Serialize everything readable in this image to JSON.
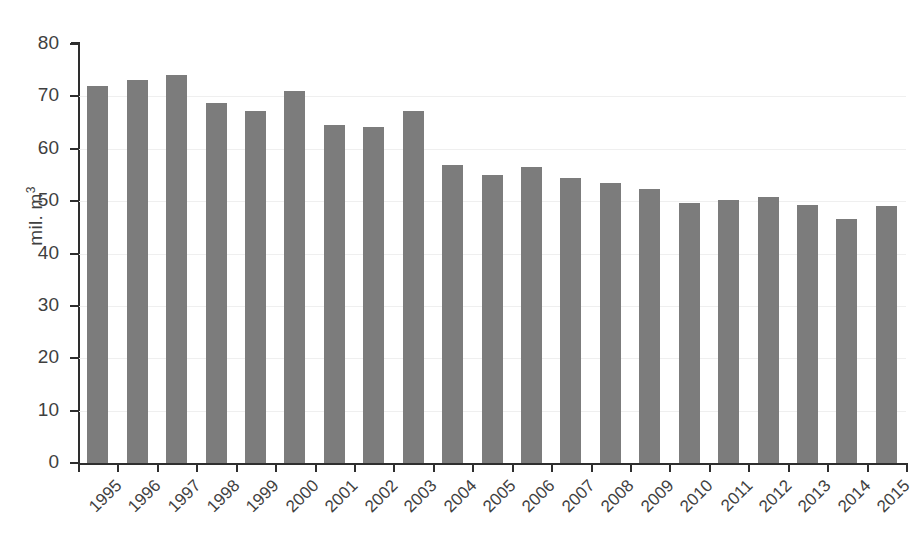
{
  "chart_data": {
    "type": "bar",
    "title": "",
    "subtitle": "",
    "xlabel": "",
    "ylabel": "mil. m",
    "ylabel_superscript": "3",
    "ylim": [
      0,
      80
    ],
    "yticks": [
      0,
      10,
      20,
      30,
      40,
      50,
      60,
      70,
      80
    ],
    "ytick_labels": [
      "0",
      "10",
      "20",
      "30",
      "40",
      "50",
      "60",
      "70",
      "80"
    ],
    "grid": true,
    "legend": "none",
    "bar_color": "#7c7c7c",
    "axis_color": "#2e2e2e",
    "gridline_color": "#efefef",
    "categories": [
      "1995",
      "1996",
      "1997",
      "1998",
      "1999",
      "2000",
      "2001",
      "2002",
      "2003",
      "2004",
      "2005",
      "2006",
      "2007",
      "2008",
      "2009",
      "2010",
      "2011",
      "2012",
      "2013",
      "2014",
      "2015"
    ],
    "values": [
      71.9,
      73.2,
      74.1,
      68.8,
      67.2,
      71.0,
      64.6,
      64.2,
      67.2,
      56.9,
      54.9,
      56.6,
      54.5,
      53.4,
      52.3,
      49.6,
      50.2,
      50.7,
      49.2,
      46.6,
      49.1
    ],
    "xtick_rotation": -45
  }
}
